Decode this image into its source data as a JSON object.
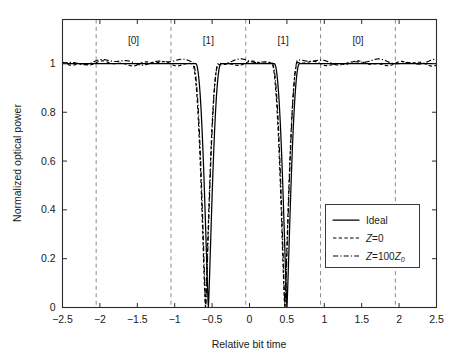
{
  "chart_data": {
    "type": "line",
    "title": "",
    "xlabel": "Relative bit time",
    "ylabel": "Normalized optical power",
    "xlim": [
      -2.5,
      2.5
    ],
    "ylim": [
      0,
      1.18
    ],
    "grid": false,
    "legend_position": "center-right",
    "xticks": [
      "-2.5",
      "-2",
      "-1.5",
      "-1",
      "-0.5",
      "0",
      "0.5",
      "1",
      "1.5",
      "2",
      "2.5"
    ],
    "xtick_values": [
      -2.5,
      -2,
      -1.5,
      -1,
      -0.5,
      0,
      0.5,
      1,
      1.5,
      2,
      2.5
    ],
    "yticks": [
      "0",
      "0.2",
      "0.4",
      "0.6",
      "0.8",
      "1"
    ],
    "ytick_values": [
      0,
      0.2,
      0.4,
      0.6,
      0.8,
      1
    ],
    "bit_boundaries": [
      -2.05,
      -1.05,
      -0.05,
      0.95,
      1.95
    ],
    "bit_annotations": [
      {
        "label": "[0]",
        "x": -1.55
      },
      {
        "label": "[1]",
        "x": -0.55
      },
      {
        "label": "[1]",
        "x": 0.45
      },
      {
        "label": "[0]",
        "x": 1.45
      }
    ],
    "series": [
      {
        "name": "Ideal",
        "style": "solid",
        "dip_centers": [
          -0.55,
          0.5
        ],
        "dip_depth": 0,
        "baseline": 1.0,
        "x": [
          -2.5,
          -2.3,
          -2.1,
          -1.9,
          -1.7,
          -1.5,
          -1.3,
          -1.1,
          -0.95,
          -0.85,
          -0.8,
          -0.76,
          -0.72,
          -0.69,
          -0.66,
          -0.64,
          -0.62,
          -0.605,
          -0.59,
          -0.575,
          -0.565,
          -0.558,
          -0.552,
          -0.548,
          -0.545,
          -0.542,
          -0.538,
          -0.533,
          -0.527,
          -0.52,
          -0.51,
          -0.5,
          -0.48,
          -0.46,
          -0.43,
          -0.4,
          -0.35,
          -0.3,
          -0.24,
          -0.18,
          -0.12,
          -0.06,
          0,
          0.06,
          0.12,
          0.18,
          0.24,
          0.3,
          0.35,
          0.4,
          0.43,
          0.455,
          0.47,
          0.48,
          0.487,
          0.492,
          0.496,
          0.499,
          0.502,
          0.506,
          0.511,
          0.518,
          0.527,
          0.54,
          0.555,
          0.575,
          0.6,
          0.63,
          0.67,
          0.72,
          0.78,
          0.85,
          0.92,
          1.0,
          1.1,
          1.3,
          1.5,
          1.7,
          1.9,
          2.1,
          2.3,
          2.5
        ],
        "y": [
          1.0,
          1.0,
          1.0,
          1.0,
          1.0,
          1.0,
          1.0,
          0.999,
          0.996,
          0.989,
          0.982,
          0.973,
          0.957,
          0.94,
          0.912,
          0.885,
          0.845,
          0.8,
          0.73,
          0.62,
          0.53,
          0.44,
          0.33,
          0.25,
          0.18,
          0.11,
          0.04,
          0.0,
          0.06,
          0.15,
          0.3,
          0.46,
          0.68,
          0.8,
          0.89,
          0.935,
          0.968,
          0.983,
          0.991,
          0.995,
          0.997,
          0.998,
          0.998,
          0.998,
          0.997,
          0.995,
          0.991,
          0.983,
          0.968,
          0.935,
          0.89,
          0.82,
          0.74,
          0.65,
          0.54,
          0.44,
          0.3,
          0.14,
          0.0,
          0.13,
          0.3,
          0.47,
          0.64,
          0.79,
          0.875,
          0.93,
          0.965,
          0.982,
          0.991,
          0.996,
          0.998,
          0.999,
          1.0,
          1.0,
          1.0,
          1.0,
          1.0,
          1.0,
          1.0,
          1.0,
          1.0,
          1.0
        ]
      },
      {
        "name": "Z=0",
        "style": "dashed",
        "dip_centers": [
          -0.59,
          0.47
        ],
        "dip_depth": 0,
        "baseline": 1.0,
        "ripple": true
      },
      {
        "name": "Z=100Z0",
        "style": "dashdot",
        "dip_centers": [
          -0.585,
          0.475
        ],
        "dip_depth": 0,
        "baseline": 1.005,
        "ripple": true
      }
    ]
  },
  "legend": {
    "entries": [
      {
        "label": "Ideal",
        "label_plain": "Ideal",
        "style": "solid",
        "italic_prefix": "",
        "body": "",
        "sub": ""
      },
      {
        "label": "Z=0",
        "italic_prefix": "Z",
        "body": "=0",
        "sub": "",
        "style": "dashed"
      },
      {
        "label": "Z=100Z0",
        "italic_prefix": "Z",
        "body": "=100",
        "italic_second": "Z",
        "sub": "0",
        "style": "dashdot"
      }
    ]
  },
  "colors": {
    "curve": "#000000",
    "axis": "#2b2b2b",
    "gridline": "#8a8a8a",
    "background": "#ffffff",
    "legend_border": "#3a3a3a"
  }
}
